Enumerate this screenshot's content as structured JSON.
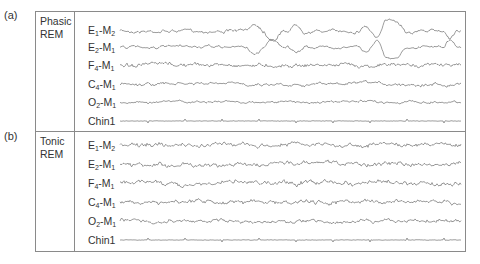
{
  "figure": {
    "panels": [
      {
        "letter": "(a)",
        "state_line1": "Phasic",
        "state_line2": "REM",
        "channels": [
          {
            "base": "E",
            "sub1": "1",
            "ref": "M",
            "sub2": "2",
            "label": "E1-M2"
          },
          {
            "base": "E",
            "sub1": "2",
            "ref": "M",
            "sub2": "1",
            "label": "E2-M1"
          },
          {
            "base": "F",
            "sub1": "4",
            "ref": "M",
            "sub2": "1",
            "label": "F4-M1"
          },
          {
            "base": "C",
            "sub1": "4",
            "ref": "M",
            "sub2": "1",
            "label": "C4-M1"
          },
          {
            "base": "O",
            "sub1": "2",
            "ref": "M",
            "sub2": "1",
            "label": "O2-M1"
          },
          {
            "plain": "Chin1",
            "label": "Chin1"
          }
        ]
      },
      {
        "letter": "(b)",
        "state_line1": "Tonic",
        "state_line2": "REM",
        "channels": [
          {
            "base": "E",
            "sub1": "1",
            "ref": "M",
            "sub2": "2",
            "label": "E1-M2"
          },
          {
            "base": "E",
            "sub1": "2",
            "ref": "M",
            "sub2": "1",
            "label": "E2-M1"
          },
          {
            "base": "F",
            "sub1": "4",
            "ref": "M",
            "sub2": "1",
            "label": "F4-M1"
          },
          {
            "base": "C",
            "sub1": "4",
            "ref": "M",
            "sub2": "1",
            "label": "C4-M1"
          },
          {
            "base": "O",
            "sub1": "2",
            "ref": "M",
            "sub2": "1",
            "label": "O2-M1"
          },
          {
            "plain": "Chin1",
            "label": "Chin1"
          }
        ]
      }
    ],
    "trace_color": "#5a5a5a",
    "frame_color": "#8a8a8a"
  }
}
